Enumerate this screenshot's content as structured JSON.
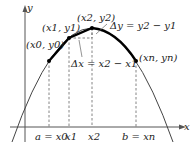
{
  "axes": {
    "x_label": "x",
    "y_label": "y"
  },
  "points": [
    {
      "id": "p0",
      "label": "(x0, y0)",
      "sx": 49,
      "sy": 61
    },
    {
      "id": "p1",
      "label": "(x1, y1)",
      "sx": 69,
      "sy": 38
    },
    {
      "id": "p2",
      "label": "(x2, y2)",
      "sx": 92,
      "sy": 28
    },
    {
      "id": "pn",
      "label": "(xn, yn)",
      "sx": 136,
      "sy": 61
    }
  ],
  "annotations": {
    "delta_y": "Δy = y2 − y1",
    "delta_x": "Δx = x2 − x1"
  },
  "ticks": [
    {
      "label": "a = x0",
      "sx": 49
    },
    {
      "label": "x1",
      "sx": 69
    },
    {
      "label": "x2",
      "sx": 92
    },
    {
      "label": "b = xn",
      "sx": 136
    }
  ],
  "colors": {
    "curve": "#333333",
    "arc": "#000000",
    "axis": "#555555",
    "dashed": "#666666"
  }
}
